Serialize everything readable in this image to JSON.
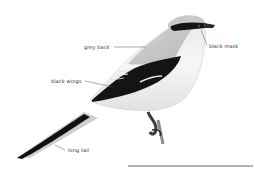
{
  "diagram": {
    "labels": [
      {
        "id": "grey-back",
        "text": "grey back"
      },
      {
        "id": "black-mask",
        "text": "black mask"
      },
      {
        "id": "black-wings",
        "text": "black wings"
      },
      {
        "id": "long-tail",
        "text": "long tail"
      }
    ]
  },
  "colors": {
    "background": "#ffffff",
    "back": "#c8c8c8",
    "mask": "#1a1a1a",
    "wing": "#141414",
    "underside": "#f4f4f4",
    "leader_line": "#555555",
    "baseline": "#444444"
  }
}
